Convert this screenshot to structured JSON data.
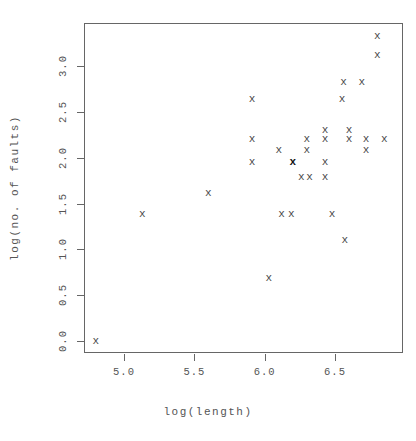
{
  "figure": {
    "background": "#ffffff",
    "frame_color": "#666666",
    "text_color": "#555555",
    "point_color": "#4a4a4a",
    "highlight_color": "#111111"
  },
  "axis": {
    "x_title": "log(length)",
    "y_title": "log(no. of faults)",
    "x_ticks": [
      "5.0",
      "5.5",
      "6.0",
      "6.5"
    ],
    "y_ticks": [
      "0.0",
      "0.5",
      "1.0",
      "1.5",
      "2.0",
      "2.5",
      "3.0"
    ]
  },
  "chart_data": {
    "type": "scatter",
    "title": "",
    "xlabel": "log(length)",
    "ylabel": "log(no. of faults)",
    "xlim": [
      4.71,
      6.99
    ],
    "ylim": [
      -0.13,
      3.47
    ],
    "xticks": [
      5.0,
      5.5,
      6.0,
      6.5
    ],
    "yticks": [
      0.0,
      0.5,
      1.0,
      1.5,
      2.0,
      2.5,
      3.0
    ],
    "grid": false,
    "legend": null,
    "marker": "x",
    "points": [
      {
        "x": 4.8,
        "y": 0.0,
        "highlight": false
      },
      {
        "x": 5.13,
        "y": 1.39,
        "highlight": false
      },
      {
        "x": 5.6,
        "y": 1.61,
        "highlight": false
      },
      {
        "x": 5.91,
        "y": 2.64,
        "highlight": false
      },
      {
        "x": 5.91,
        "y": 2.2,
        "highlight": false
      },
      {
        "x": 5.91,
        "y": 1.95,
        "highlight": false
      },
      {
        "x": 6.03,
        "y": 0.69,
        "highlight": false
      },
      {
        "x": 6.1,
        "y": 2.08,
        "highlight": false
      },
      {
        "x": 6.12,
        "y": 1.39,
        "highlight": false
      },
      {
        "x": 6.19,
        "y": 1.39,
        "highlight": false
      },
      {
        "x": 6.2,
        "y": 1.95,
        "highlight": true
      },
      {
        "x": 6.26,
        "y": 1.79,
        "highlight": false
      },
      {
        "x": 6.32,
        "y": 1.79,
        "highlight": false
      },
      {
        "x": 6.3,
        "y": 2.2,
        "highlight": false
      },
      {
        "x": 6.3,
        "y": 2.08,
        "highlight": false
      },
      {
        "x": 6.43,
        "y": 2.3,
        "highlight": false
      },
      {
        "x": 6.43,
        "y": 2.2,
        "highlight": false
      },
      {
        "x": 6.43,
        "y": 1.95,
        "highlight": false
      },
      {
        "x": 6.43,
        "y": 1.79,
        "highlight": false
      },
      {
        "x": 6.48,
        "y": 1.39,
        "highlight": false
      },
      {
        "x": 6.56,
        "y": 2.83,
        "highlight": false
      },
      {
        "x": 6.55,
        "y": 2.64,
        "highlight": false
      },
      {
        "x": 6.57,
        "y": 1.1,
        "highlight": false
      },
      {
        "x": 6.6,
        "y": 2.3,
        "highlight": false
      },
      {
        "x": 6.6,
        "y": 2.2,
        "highlight": false
      },
      {
        "x": 6.69,
        "y": 2.83,
        "highlight": false
      },
      {
        "x": 6.72,
        "y": 2.2,
        "highlight": false
      },
      {
        "x": 6.72,
        "y": 2.08,
        "highlight": false
      },
      {
        "x": 6.8,
        "y": 3.33,
        "highlight": false
      },
      {
        "x": 6.8,
        "y": 3.12,
        "highlight": false
      },
      {
        "x": 6.85,
        "y": 2.2,
        "highlight": false
      }
    ]
  }
}
